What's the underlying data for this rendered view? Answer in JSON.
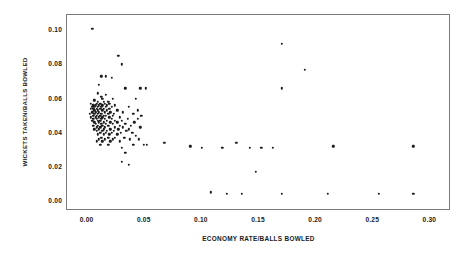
{
  "chart_data": {
    "type": "scatter",
    "title": "",
    "xlabel": "ECONOMY RATE/BALLS BOWLED",
    "ylabel": "WICKETS TAKEN/BALLS BOWLED",
    "xlim": [
      -0.018,
      0.318
    ],
    "ylim": [
      -0.006,
      0.109
    ],
    "xticks": [
      0.0,
      0.05,
      0.1,
      0.15,
      0.2,
      0.25,
      0.3
    ],
    "xticklabels": [
      "0.00",
      "0.05",
      "0.10",
      "0.15",
      "0.20",
      "0.25",
      "0.30"
    ],
    "yticks": [
      0.0,
      0.02,
      0.04,
      0.06,
      0.08,
      0.1
    ],
    "yticklabels": [
      "0.00",
      "0.02",
      "0.04",
      "0.06",
      "0.08",
      "0.10"
    ],
    "grid": false,
    "legend": null,
    "marker": "filled-circle",
    "marker_color": "#1c1c1c",
    "points": [
      [
        0.004,
        0.101
      ],
      [
        0.17,
        0.092
      ],
      [
        0.027,
        0.085
      ],
      [
        0.03,
        0.08
      ],
      [
        0.012,
        0.073
      ],
      [
        0.016,
        0.073
      ],
      [
        0.021,
        0.072
      ],
      [
        0.19,
        0.077
      ],
      [
        0.01,
        0.068
      ],
      [
        0.033,
        0.066
      ],
      [
        0.046,
        0.066
      ],
      [
        0.051,
        0.066
      ],
      [
        0.17,
        0.066
      ],
      [
        0.009,
        0.063
      ],
      [
        0.016,
        0.062
      ],
      [
        0.012,
        0.061
      ],
      [
        0.013,
        0.06
      ],
      [
        0.022,
        0.06
      ],
      [
        0.042,
        0.06
      ],
      [
        0.006,
        0.059
      ],
      [
        0.009,
        0.058
      ],
      [
        0.014,
        0.058
      ],
      [
        0.018,
        0.058
      ],
      [
        0.003,
        0.057
      ],
      [
        0.008,
        0.057
      ],
      [
        0.011,
        0.057
      ],
      [
        0.015,
        0.057
      ],
      [
        0.019,
        0.057
      ],
      [
        0.005,
        0.056
      ],
      [
        0.007,
        0.056
      ],
      [
        0.01,
        0.056
      ],
      [
        0.013,
        0.056
      ],
      [
        0.017,
        0.056
      ],
      [
        0.024,
        0.056
      ],
      [
        0.004,
        0.055
      ],
      [
        0.006,
        0.055
      ],
      [
        0.009,
        0.055
      ],
      [
        0.012,
        0.055
      ],
      [
        0.016,
        0.055
      ],
      [
        0.021,
        0.055
      ],
      [
        0.036,
        0.055
      ],
      [
        0.003,
        0.054
      ],
      [
        0.005,
        0.054
      ],
      [
        0.008,
        0.054
      ],
      [
        0.011,
        0.054
      ],
      [
        0.014,
        0.054
      ],
      [
        0.019,
        0.054
      ],
      [
        0.044,
        0.053
      ],
      [
        0.006,
        0.053
      ],
      [
        0.009,
        0.053
      ],
      [
        0.013,
        0.053
      ],
      [
        0.017,
        0.053
      ],
      [
        0.026,
        0.053
      ],
      [
        0.004,
        0.052
      ],
      [
        0.007,
        0.052
      ],
      [
        0.01,
        0.052
      ],
      [
        0.015,
        0.052
      ],
      [
        0.02,
        0.052
      ],
      [
        0.031,
        0.052
      ],
      [
        0.002,
        0.051
      ],
      [
        0.006,
        0.051
      ],
      [
        0.009,
        0.051
      ],
      [
        0.012,
        0.051
      ],
      [
        0.018,
        0.051
      ],
      [
        0.023,
        0.051
      ],
      [
        0.04,
        0.051
      ],
      [
        0.005,
        0.05
      ],
      [
        0.008,
        0.05
      ],
      [
        0.011,
        0.05
      ],
      [
        0.014,
        0.05
      ],
      [
        0.016,
        0.05
      ],
      [
        0.022,
        0.05
      ],
      [
        0.047,
        0.05
      ],
      [
        0.003,
        0.049
      ],
      [
        0.007,
        0.049
      ],
      [
        0.01,
        0.049
      ],
      [
        0.013,
        0.049
      ],
      [
        0.019,
        0.049
      ],
      [
        0.028,
        0.049
      ],
      [
        0.005,
        0.048
      ],
      [
        0.008,
        0.048
      ],
      [
        0.012,
        0.048
      ],
      [
        0.015,
        0.048
      ],
      [
        0.021,
        0.048
      ],
      [
        0.035,
        0.048
      ],
      [
        0.044,
        0.048
      ],
      [
        0.004,
        0.047
      ],
      [
        0.009,
        0.047
      ],
      [
        0.011,
        0.047
      ],
      [
        0.017,
        0.047
      ],
      [
        0.024,
        0.047
      ],
      [
        0.03,
        0.047
      ],
      [
        0.006,
        0.046
      ],
      [
        0.01,
        0.046
      ],
      [
        0.014,
        0.046
      ],
      [
        0.02,
        0.046
      ],
      [
        0.026,
        0.046
      ],
      [
        0.041,
        0.046
      ],
      [
        0.007,
        0.045
      ],
      [
        0.012,
        0.045
      ],
      [
        0.016,
        0.045
      ],
      [
        0.022,
        0.045
      ],
      [
        0.033,
        0.045
      ],
      [
        0.005,
        0.044
      ],
      [
        0.009,
        0.044
      ],
      [
        0.013,
        0.044
      ],
      [
        0.018,
        0.044
      ],
      [
        0.028,
        0.044
      ],
      [
        0.038,
        0.044
      ],
      [
        0.008,
        0.043
      ],
      [
        0.011,
        0.043
      ],
      [
        0.015,
        0.043
      ],
      [
        0.024,
        0.043
      ],
      [
        0.031,
        0.043
      ],
      [
        0.046,
        0.043
      ],
      [
        0.006,
        0.042
      ],
      [
        0.01,
        0.042
      ],
      [
        0.014,
        0.042
      ],
      [
        0.02,
        0.042
      ],
      [
        0.027,
        0.042
      ],
      [
        0.036,
        0.042
      ],
      [
        0.008,
        0.041
      ],
      [
        0.013,
        0.041
      ],
      [
        0.017,
        0.041
      ],
      [
        0.023,
        0.041
      ],
      [
        0.034,
        0.041
      ],
      [
        0.011,
        0.04
      ],
      [
        0.016,
        0.04
      ],
      [
        0.021,
        0.04
      ],
      [
        0.029,
        0.04
      ],
      [
        0.039,
        0.04
      ],
      [
        0.009,
        0.039
      ],
      [
        0.014,
        0.039
      ],
      [
        0.019,
        0.039
      ],
      [
        0.026,
        0.039
      ],
      [
        0.042,
        0.038
      ],
      [
        0.012,
        0.037
      ],
      [
        0.018,
        0.037
      ],
      [
        0.024,
        0.037
      ],
      [
        0.032,
        0.037
      ],
      [
        0.01,
        0.036
      ],
      [
        0.015,
        0.036
      ],
      [
        0.022,
        0.036
      ],
      [
        0.037,
        0.036
      ],
      [
        0.045,
        0.036
      ],
      [
        0.008,
        0.035
      ],
      [
        0.013,
        0.035
      ],
      [
        0.02,
        0.035
      ],
      [
        0.028,
        0.035
      ],
      [
        0.067,
        0.034
      ],
      [
        0.09,
        0.032
      ],
      [
        0.1,
        0.031
      ],
      [
        0.118,
        0.031
      ],
      [
        0.13,
        0.034
      ],
      [
        0.142,
        0.031
      ],
      [
        0.152,
        0.031
      ],
      [
        0.162,
        0.031
      ],
      [
        0.215,
        0.032
      ],
      [
        0.285,
        0.032
      ],
      [
        0.03,
        0.031
      ],
      [
        0.04,
        0.033
      ],
      [
        0.049,
        0.033
      ],
      [
        0.052,
        0.033
      ],
      [
        0.018,
        0.033
      ],
      [
        0.011,
        0.033
      ],
      [
        0.033,
        0.028
      ],
      [
        0.03,
        0.023
      ],
      [
        0.036,
        0.021
      ],
      [
        0.147,
        0.017
      ],
      [
        0.108,
        0.005
      ],
      [
        0.122,
        0.004
      ],
      [
        0.135,
        0.004
      ],
      [
        0.17,
        0.004
      ],
      [
        0.21,
        0.004
      ],
      [
        0.255,
        0.004
      ],
      [
        0.285,
        0.004
      ]
    ]
  },
  "axes": {
    "frame_color": "#7a7a7a",
    "background": "#ffffff"
  }
}
